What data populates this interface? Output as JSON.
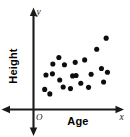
{
  "chart_data": {
    "type": "scatter",
    "title": "",
    "xlabel": "Age",
    "ylabel": "Height",
    "x_axis_letter": "x",
    "y_axis_letter": "y",
    "origin_label": "O",
    "grid": false,
    "legend": null,
    "xlim": [
      0,
      10
    ],
    "ylim": [
      0,
      10
    ],
    "axis_arrows": "both-ends-both-axes",
    "point_color": "#0d0d0d",
    "axis_color": "#1a1a1a",
    "background_color": "#ffffff",
    "point_count": 22,
    "points": [
      {
        "x": 1.3,
        "y": 2.45
      },
      {
        "x": 1.9,
        "y": 1.9
      },
      {
        "x": 1.45,
        "y": 4.2
      },
      {
        "x": 2.25,
        "y": 5.55
      },
      {
        "x": 2.95,
        "y": 6.35
      },
      {
        "x": 2.2,
        "y": 4.35
      },
      {
        "x": 3.05,
        "y": 3.6
      },
      {
        "x": 3.6,
        "y": 5.45
      },
      {
        "x": 3.45,
        "y": 2.75
      },
      {
        "x": 4.3,
        "y": 2.55
      },
      {
        "x": 4.55,
        "y": 4.1
      },
      {
        "x": 4.95,
        "y": 4.15
      },
      {
        "x": 4.85,
        "y": 5.75
      },
      {
        "x": 5.5,
        "y": 3.2
      },
      {
        "x": 5.95,
        "y": 6.05
      },
      {
        "x": 6.4,
        "y": 2.7
      },
      {
        "x": 6.7,
        "y": 4.3
      },
      {
        "x": 7.35,
        "y": 7.35
      },
      {
        "x": 7.9,
        "y": 5.0
      },
      {
        "x": 8.15,
        "y": 3.35
      },
      {
        "x": 8.6,
        "y": 4.55
      },
      {
        "x": 8.45,
        "y": 8.7
      }
    ]
  },
  "figure": {
    "alt": "Scatter plot with vertical axis labeled Height and horizontal axis labeled Age"
  }
}
